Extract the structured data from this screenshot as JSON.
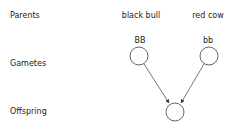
{
  "rows": {
    "parents": "Parents",
    "gametes": "Gametes",
    "offspring": "Offspring"
  },
  "parents": [
    {
      "name": "black bull",
      "genotype": "BB"
    },
    {
      "name": "red cow",
      "genotype": "bb"
    }
  ],
  "colors": {
    "stroke": "#555555",
    "text": "#222222"
  }
}
